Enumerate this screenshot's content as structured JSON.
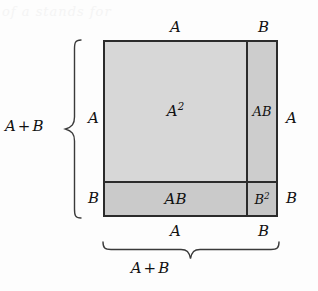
{
  "figure": {
    "background_color": "#fdfdfd",
    "ink_color": "#1a1a1a",
    "scan_artifact_text": "of a   stands   for"
  },
  "square": {
    "border_color": "#2b2b2b",
    "regions": [
      {
        "id": "a-squared",
        "label": "A",
        "exponent": "2",
        "fill": "#d7d7d7",
        "meaning": "A squared"
      },
      {
        "id": "ab-right",
        "label": "AB",
        "exponent": "",
        "fill": "#cdcdcd",
        "meaning": "A times B"
      },
      {
        "id": "ab-bottom",
        "label": "AB",
        "exponent": "",
        "fill": "#cacaca",
        "meaning": "A times B"
      },
      {
        "id": "b-squared",
        "label": "B",
        "exponent": "2",
        "fill": "#c6c6c6",
        "meaning": "B squared"
      }
    ]
  },
  "edges": {
    "top": {
      "segment_a": "A",
      "segment_b": "B"
    },
    "right": {
      "segment_a": "A",
      "segment_b": "B"
    },
    "left": {
      "segment_a": "A",
      "segment_b": "B"
    },
    "bottom": {
      "segment_a": "A",
      "segment_b": "B"
    }
  },
  "braces": {
    "left": {
      "total_first": "A",
      "total_op": "+",
      "total_second": "B"
    },
    "bottom": {
      "total_first": "A",
      "total_op": "+",
      "total_second": "B"
    }
  }
}
